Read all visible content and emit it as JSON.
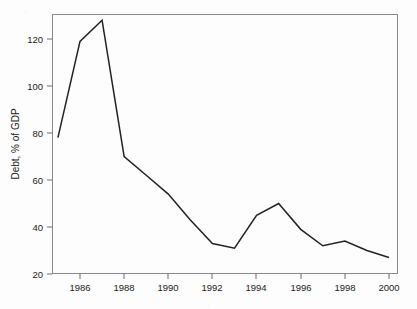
{
  "chart_data": {
    "type": "line",
    "title": "",
    "subtitle": "",
    "xlabel": "",
    "ylabel": "Debt, % of GDP",
    "x": [
      1985,
      1986,
      1987,
      1988,
      1989,
      1990,
      1991,
      1992,
      1993,
      1994,
      1995,
      1996,
      1997,
      1998,
      1999,
      2000
    ],
    "values": [
      78,
      119,
      128,
      70,
      62,
      54,
      43,
      33,
      31,
      45,
      50,
      39,
      32,
      34,
      30,
      27
    ],
    "series": [
      {
        "name": "Debt, % of GDP",
        "values": [
          78,
          119,
          128,
          70,
          62,
          54,
          43,
          33,
          31,
          45,
          50,
          39,
          32,
          34,
          30,
          27
        ]
      }
    ],
    "xlim": [
      1985,
      2000.7
    ],
    "ylim": [
      14,
      132
    ],
    "xticks": [
      1986,
      1988,
      1990,
      1992,
      1994,
      1996,
      1998,
      2000
    ],
    "xtick_labels": [
      "1986",
      "1988",
      "1990",
      "1992",
      "1994",
      "1996",
      "1998",
      "2000"
    ],
    "yticks": [
      20,
      40,
      60,
      80,
      100,
      120
    ],
    "ytick_labels": [
      "20",
      "40",
      "60",
      "80",
      "100",
      "120"
    ],
    "grid": false,
    "legend": false,
    "legend_position": "none",
    "line_color": "#222222",
    "frame_color": "#8a8a8a",
    "background_color": "#fdfdfd"
  }
}
